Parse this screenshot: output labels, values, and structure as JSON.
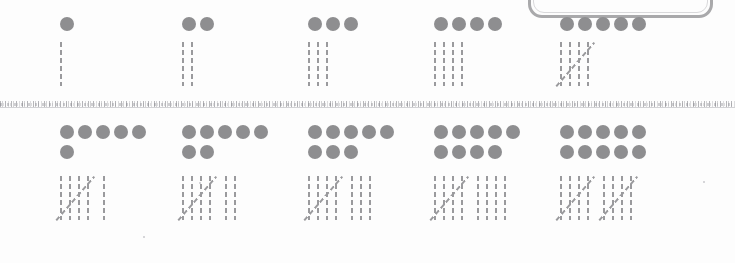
{
  "document": {
    "title": "Numbers 1 to 10 — Dots and Tally Marks Worksheet",
    "type": "math-worksheet",
    "dot_color": "#8e8e90",
    "tally_color": "#9a9a9d",
    "divider_color": "#a5a5aa",
    "background_color": "#fdfdfd",
    "frame_color": "#a9a9ab"
  },
  "frame": {
    "label": "clipped rounded rectangle outline",
    "visible_portion": "bottom edge and lower corners"
  },
  "divider": {
    "label": "horizontal textured scan line separating the two rows"
  },
  "rows": [
    {
      "name": "top-row",
      "cells": [
        {
          "value": 1,
          "dot_rows": [
            1
          ],
          "tally_groups": [
            {
              "count": 1,
              "struck": false
            }
          ],
          "left": 60
        },
        {
          "value": 2,
          "dot_rows": [
            2
          ],
          "tally_groups": [
            {
              "count": 2,
              "struck": false
            }
          ],
          "left": 182
        },
        {
          "value": 3,
          "dot_rows": [
            3
          ],
          "tally_groups": [
            {
              "count": 3,
              "struck": false
            }
          ],
          "left": 308
        },
        {
          "value": 4,
          "dot_rows": [
            4
          ],
          "tally_groups": [
            {
              "count": 4,
              "struck": false
            }
          ],
          "left": 434
        },
        {
          "value": 5,
          "dot_rows": [
            5
          ],
          "tally_groups": [
            {
              "count": 4,
              "struck": true
            }
          ],
          "left": 560
        }
      ]
    },
    {
      "name": "bottom-row",
      "cells": [
        {
          "value": 6,
          "dot_rows": [
            5,
            1
          ],
          "tally_groups": [
            {
              "count": 4,
              "struck": true
            },
            {
              "count": 1,
              "struck": false
            }
          ],
          "left": 60
        },
        {
          "value": 7,
          "dot_rows": [
            5,
            2
          ],
          "tally_groups": [
            {
              "count": 4,
              "struck": true
            },
            {
              "count": 2,
              "struck": false
            }
          ],
          "left": 182
        },
        {
          "value": 8,
          "dot_rows": [
            5,
            3
          ],
          "tally_groups": [
            {
              "count": 4,
              "struck": true
            },
            {
              "count": 3,
              "struck": false
            }
          ],
          "left": 308
        },
        {
          "value": 9,
          "dot_rows": [
            5,
            4
          ],
          "tally_groups": [
            {
              "count": 4,
              "struck": true
            },
            {
              "count": 4,
              "struck": false
            }
          ],
          "left": 434
        },
        {
          "value": 10,
          "dot_rows": [
            5,
            5
          ],
          "tally_groups": [
            {
              "count": 4,
              "struck": true
            },
            {
              "count": 4,
              "struck": true
            }
          ],
          "left": 560
        }
      ]
    }
  ],
  "specks": [
    {
      "x": 703,
      "y": 181
    },
    {
      "x": 199,
      "y": 182
    },
    {
      "x": 143,
      "y": 236
    }
  ]
}
